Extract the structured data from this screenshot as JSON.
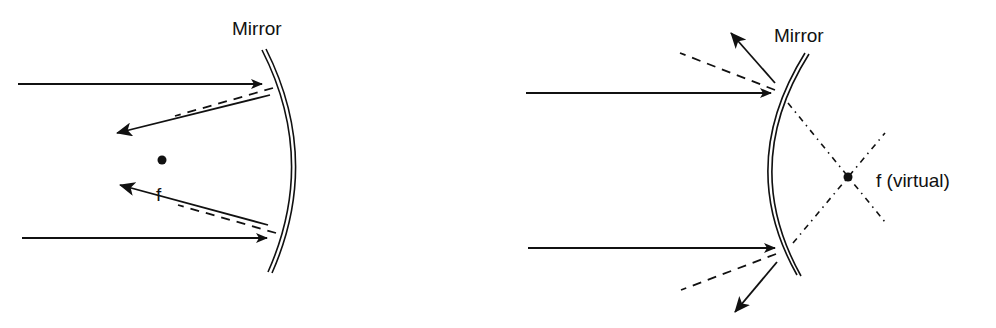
{
  "colors": {
    "ink": "#111111",
    "background": "#ffffff"
  },
  "left_diagram": {
    "title": "Concave mirror",
    "mirror_label": "Mirror",
    "focal_label": "f",
    "mirror": {
      "top": [
        262,
        50
      ],
      "bulge": [
        300,
        160
      ],
      "bottom": [
        270,
        272
      ]
    },
    "focal_point": [
      162,
      160
    ],
    "incident_rays": [
      {
        "from": [
          18,
          84
        ],
        "to": [
          262,
          84
        ]
      },
      {
        "from": [
          22,
          238
        ],
        "to": [
          267,
          238
        ]
      }
    ],
    "reflected_rays": [
      {
        "from": [
          270,
          95
        ],
        "to": [
          117,
          133
        ]
      },
      {
        "from": [
          268,
          225
        ],
        "to": [
          120,
          185
        ]
      }
    ],
    "dashed_rays": [
      {
        "from": [
          273,
          88
        ],
        "to": [
          175,
          116
        ]
      },
      {
        "from": [
          276,
          233
        ],
        "to": [
          178,
          205
        ]
      }
    ]
  },
  "right_diagram": {
    "title": "Convex mirror",
    "mirror_label": "Mirror",
    "focal_label": "f (virtual)",
    "mirror": {
      "top": [
        807,
        53
      ],
      "bulge": [
        770,
        165
      ],
      "bottom": [
        800,
        275
      ]
    },
    "focal_point": [
      848,
      177
    ],
    "incident_rays": [
      {
        "from": [
          526,
          93
        ],
        "to": [
          771,
          93
        ]
      },
      {
        "from": [
          528,
          248
        ],
        "to": [
          775,
          248
        ]
      }
    ],
    "reflected_rays": [
      {
        "from": [
          775,
          83
        ],
        "to": [
          731,
          33
        ]
      },
      {
        "from": [
          777,
          262
        ],
        "to": [
          735,
          312
        ]
      }
    ],
    "dashed_rays": [
      {
        "from": [
          775,
          90
        ],
        "to": [
          680,
          53
        ]
      },
      {
        "from": [
          776,
          254
        ],
        "to": [
          681,
          290
        ]
      }
    ],
    "virtual_extensions": [
      {
        "from": [
          788,
          103
        ],
        "to": [
          885,
          222
        ]
      },
      {
        "from": [
          793,
          243
        ],
        "to": [
          885,
          133
        ]
      }
    ]
  }
}
